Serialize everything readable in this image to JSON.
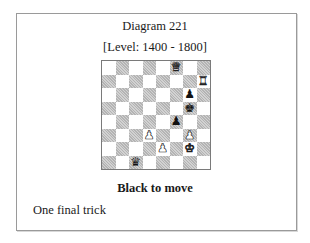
{
  "diagram": {
    "title": "Diagram 221",
    "level": "[Level: 1400 - 1800]",
    "to_move": "Black to move",
    "caption": "One final trick"
  },
  "board": {
    "files": [
      "a",
      "b",
      "c",
      "d",
      "e",
      "f",
      "g",
      "h"
    ],
    "ranks": [
      8,
      7,
      6,
      5,
      4,
      3,
      2,
      1
    ],
    "top_left_square_color": "light",
    "colors": {
      "light": "#ffffff",
      "dark": "#c4c4c4",
      "border": "#7a7a7a"
    },
    "pieces": [
      {
        "square": "f8",
        "color": "white",
        "type": "queen",
        "glyph": "♛"
      },
      {
        "square": "h7",
        "color": "white",
        "type": "rook",
        "glyph": "♜"
      },
      {
        "square": "g6",
        "color": "black",
        "type": "pawn",
        "glyph": "♟"
      },
      {
        "square": "g5",
        "color": "black",
        "type": "king",
        "glyph": "♚"
      },
      {
        "square": "f4",
        "color": "black",
        "type": "pawn",
        "glyph": "♟"
      },
      {
        "square": "d3",
        "color": "white",
        "type": "pawn",
        "glyph": "♟"
      },
      {
        "square": "g3",
        "color": "white",
        "type": "pawn",
        "glyph": "♟"
      },
      {
        "square": "e2",
        "color": "white",
        "type": "pawn",
        "glyph": "♟"
      },
      {
        "square": "g2",
        "color": "white",
        "type": "king",
        "glyph": "♚"
      },
      {
        "square": "c1",
        "color": "black",
        "type": "queen",
        "glyph": "♛"
      }
    ]
  }
}
